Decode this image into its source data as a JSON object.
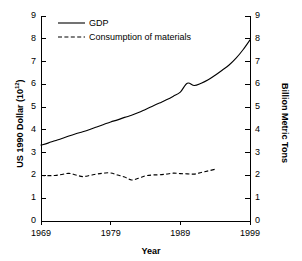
{
  "chart_data": {
    "type": "line",
    "title": "",
    "xlabel": "Year",
    "ylabel": "US 1990 Dollar (10^12)",
    "ylabel_base": "US 1990 Dollar (10",
    "ylabel_exponent": "12",
    "ylabel_tail": ")",
    "y2label": "Billion Metric Tons",
    "xlim": [
      1969,
      1999
    ],
    "ylim": [
      0,
      9
    ],
    "y2lim": [
      0,
      9
    ],
    "grid": false,
    "legend_position": "top-left-inside",
    "xticks": [
      "1969",
      "1979",
      "1989",
      "1999"
    ],
    "xtick_values": [
      1969,
      1979,
      1989,
      1999
    ],
    "yticks": [
      "0",
      "1",
      "2",
      "3",
      "4",
      "5",
      "6",
      "7",
      "8",
      "9"
    ],
    "ytick_values": [
      0,
      1,
      2,
      3,
      4,
      5,
      6,
      7,
      8,
      9
    ],
    "y2ticks": [
      "0",
      "1",
      "2",
      "3",
      "4",
      "5",
      "6",
      "7",
      "8",
      "9"
    ],
    "y2tick_values": [
      0,
      1,
      2,
      3,
      4,
      5,
      6,
      7,
      8,
      9
    ],
    "series": [
      {
        "name": "GDP",
        "style": "solid",
        "axis": "left",
        "color": "#000000",
        "x": [
          1969,
          1970,
          1971,
          1972,
          1973,
          1974,
          1975,
          1976,
          1977,
          1978,
          1979,
          1980,
          1981,
          1982,
          1983,
          1984,
          1985,
          1986,
          1987,
          1988,
          1989,
          1990,
          1991,
          1992,
          1993,
          1994,
          1995,
          1996,
          1997,
          1998,
          1999
        ],
        "values": [
          3.33,
          3.42,
          3.52,
          3.62,
          3.73,
          3.83,
          3.92,
          4.02,
          4.13,
          4.24,
          4.35,
          4.44,
          4.55,
          4.64,
          4.76,
          4.9,
          5.04,
          5.18,
          5.32,
          5.48,
          5.66,
          6.05,
          5.95,
          6.05,
          6.2,
          6.4,
          6.62,
          6.85,
          7.15,
          7.52,
          7.95
        ]
      },
      {
        "name": "Consumption of materials",
        "style": "dashed",
        "axis": "right",
        "color": "#000000",
        "x": [
          1969,
          1970,
          1971,
          1972,
          1973,
          1974,
          1975,
          1976,
          1977,
          1978,
          1979,
          1980,
          1981,
          1982,
          1983,
          1984,
          1985,
          1986,
          1987,
          1988,
          1989,
          1990,
          1991,
          1992,
          1993,
          1994
        ],
        "values": [
          2.0,
          1.99,
          2.0,
          2.04,
          2.09,
          2.02,
          1.95,
          2.0,
          2.06,
          2.1,
          2.11,
          2.02,
          1.93,
          1.8,
          1.88,
          1.98,
          2.02,
          2.03,
          2.06,
          2.1,
          2.08,
          2.07,
          2.06,
          2.13,
          2.2,
          2.27
        ]
      }
    ]
  },
  "legend": {
    "items": [
      {
        "label": "GDP",
        "style": "solid"
      },
      {
        "label": "Consumption of materials",
        "style": "dashed"
      }
    ]
  }
}
